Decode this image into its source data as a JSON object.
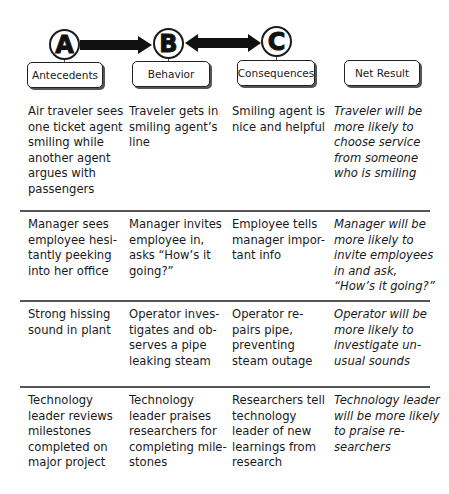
{
  "header": {
    "circles": [
      {
        "letter": "A"
      },
      {
        "letter": "B"
      },
      {
        "letter": "C"
      }
    ],
    "boxes": [
      {
        "label": "Antecedents"
      },
      {
        "label": "Behavior"
      },
      {
        "label": "Consequences"
      },
      {
        "label": "Net Result"
      }
    ],
    "arrows": [
      {
        "from": "A",
        "to": "B",
        "direction": "right"
      },
      {
        "from": "B",
        "to": "C",
        "direction": "both"
      }
    ]
  },
  "rows": [
    {
      "antecedent": [
        "Air traveler sees",
        "one ticket agent",
        "smiling while",
        "another agent",
        "argues with",
        "passengers"
      ],
      "behavior": [
        "Traveler gets in",
        "smiling agent’s",
        "line"
      ],
      "consequence": [
        "Smiling agent is",
        "nice and helpful"
      ],
      "net_result": [
        "Traveler will be",
        "more likely to",
        "choose service",
        "from someone",
        "who is smiling"
      ]
    },
    {
      "antecedent": [
        "Manager sees",
        "employee hesi-",
        "tantly peeking",
        "into her office"
      ],
      "behavior": [
        "Manager invites",
        "employee in,",
        "asks “How’s it",
        "going?”"
      ],
      "consequence": [
        "Employee tells",
        "manager impor-",
        "tant info"
      ],
      "net_result": [
        "Manager will be",
        "more likely to",
        "invite employees",
        "in and ask,",
        "“How’s it going?”"
      ]
    },
    {
      "antecedent": [
        "Strong hissing",
        "sound in plant"
      ],
      "behavior": [
        "Operator inves-",
        "tigates and ob-",
        "serves a pipe",
        "leaking steam"
      ],
      "consequence": [
        "Operator re-",
        "pairs pipe,",
        "preventing",
        "steam outage"
      ],
      "net_result": [
        "Operator will be",
        "more likely to",
        "investigate un-",
        "usual sounds"
      ]
    },
    {
      "antecedent": [
        "Technology",
        "leader reviews",
        "milestones",
        "completed on",
        "major project"
      ],
      "behavior": [
        "Technology",
        "leader praises",
        "researchers for",
        "completing mile-",
        "stones"
      ],
      "consequence": [
        "Researchers tell",
        "technology",
        "leader of new",
        "learnings from",
        "research"
      ],
      "net_result": [
        "Technology leader",
        "will be more likely",
        "to praise re-",
        "searchers"
      ]
    }
  ]
}
